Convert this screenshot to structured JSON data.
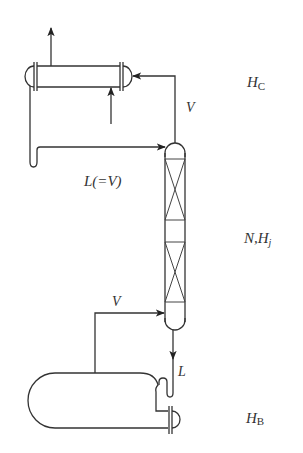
{
  "diagram": {
    "type": "distillation-column-process-flow",
    "colors": {
      "line": "#333333",
      "background": "#ffffff"
    },
    "labels": {
      "condenser_height": {
        "main": "H",
        "sub": "C"
      },
      "vapor_top": "V",
      "reflux": "L(=V)",
      "column_stages": {
        "n": "N,",
        "main": "H",
        "sub": "j"
      },
      "vapor_bottom": "V",
      "liquid_bottom": "L",
      "reboiler_height": {
        "main": "H",
        "sub": "B"
      }
    },
    "components": [
      {
        "id": "condenser",
        "kind": "shell-and-tube heat exchanger"
      },
      {
        "id": "column",
        "kind": "packed column with two packed beds"
      },
      {
        "id": "reboiler",
        "kind": "kettle reboiler"
      }
    ],
    "streams": [
      {
        "id": "vapor-overhead",
        "label": "V",
        "from": "column-top",
        "to": "condenser"
      },
      {
        "id": "reflux",
        "label": "L(=V)",
        "from": "condenser",
        "to": "column-top"
      },
      {
        "id": "boilup",
        "label": "V",
        "from": "reboiler",
        "to": "column-bottom"
      },
      {
        "id": "bottoms-liquid",
        "label": "L",
        "from": "column-bottom",
        "to": "reboiler"
      },
      {
        "id": "coolant-in",
        "label": "",
        "from": "external",
        "to": "condenser"
      },
      {
        "id": "coolant-out",
        "label": "",
        "from": "condenser",
        "to": "external"
      }
    ]
  }
}
